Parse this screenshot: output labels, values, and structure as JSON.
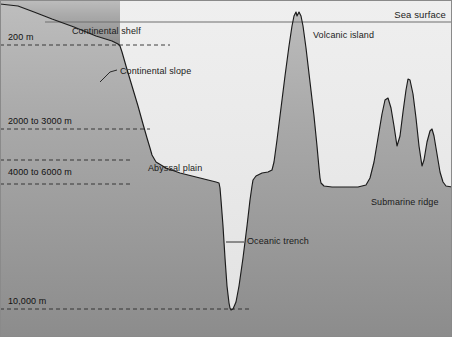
{
  "diagram": {
    "colors": {
      "water": "#e9e9e9",
      "crust_top": "#b9b9b9",
      "crust_bottom": "#8e8e8e",
      "outline": "#1b1b1b",
      "sea_surface_line": "#6f6f6f",
      "border": "#8a8a8a",
      "text": "#1b1b1b"
    },
    "sea_surface_label": "Sea surface",
    "depth_labels": [
      {
        "text": "200 m",
        "x": 8,
        "y": 33,
        "line_y": 45
      },
      {
        "text": "2000 to 3000 m",
        "x": 8,
        "y": 117,
        "line_y": 129
      },
      {
        "text": "4000 to 6000 m",
        "x": 8,
        "y": 168,
        "line_y": 160
      },
      {
        "text": "10,000 m",
        "x": 8,
        "y": 297,
        "line_y": 309
      }
    ],
    "feature_labels": [
      {
        "name": "continental-shelf",
        "text": "Continental shelf",
        "x": 72,
        "y": 27
      },
      {
        "name": "continental-slope",
        "text": "Continental slope",
        "x": 120,
        "y": 67
      },
      {
        "name": "abyssal-plain",
        "text": "Abyssal plain",
        "x": 148,
        "y": 164
      },
      {
        "name": "oceanic-trench",
        "text": "Oceanic trench",
        "x": 247,
        "y": 237
      },
      {
        "name": "volcanic-island",
        "text": "Volcanic island",
        "x": 313,
        "y": 31
      },
      {
        "name": "submarine-ridge",
        "text": "Submarine ridge",
        "x": 371,
        "y": 198
      }
    ],
    "geometry": {
      "sea_surface_y": 22,
      "dashed_lines": [
        45,
        129,
        160,
        184,
        309
      ],
      "dashed_line_right_ends": [
        170,
        150,
        132,
        132,
        250
      ],
      "seafloor_path": "M 0,4 L 18,6 L 34,12 L 52,19 L 74,27 L 96,36 L 112,41 L 118,44 L 120,46 L 122,52 L 126,66 L 132,86 L 138,106 L 143,124 L 147,138 L 150,148 L 152,155 L 156,162 L 166,168 L 180,173 L 196,177 L 208,180 L 216,182 L 219,183 L 220,188 L 221,200 L 223,226 L 225,258 L 227,286 L 229,303 L 230,308 L 231,310 L 233,309 L 236,302 L 239,286 L 243,258 L 247,226 L 250,200 L 252,186 L 253,180 L 256,176 L 262,173 L 268,172 L 272,170 L 274,162 L 277,140 L 281,108 L 285,76 L 289,46 L 292,26 L 294,16 L 296,12 L 297,16 L 299,12 L 301,16 L 303,26 L 306,48 L 310,82 L 314,116 L 317,146 L 319,168 L 320,178 L 321,183 L 324,186 L 332,187 L 344,187 L 358,187 L 366,185 L 370,178 L 374,162 L 378,138 L 382,114 L 385,100 L 388,98 L 391,108 L 394,126 L 397,146 L 400,136 L 403,112 L 406,90 L 408,79 L 410,80 L 413,94 L 416,118 L 419,146 L 422,166 L 424,160 L 427,142 L 430,131 L 432,129 L 434,136 L 437,154 L 440,172 L 443,182 L 446,186 L 452,187",
      "land_cap_path": "M 0,4 L 18,6 L 34,12 L 52,19 L 74,27 L 96,36 L 112,41 L 118,44 L 120,46 L 120,0 L 0,0 Z",
      "leader_lines": [
        {
          "name": "continental-slope-leader",
          "d": "M 100,82 L 110,72 L 117,70"
        },
        {
          "name": "oceanic-trench-leader",
          "d": "M 226,242 L 244,242"
        }
      ]
    }
  }
}
